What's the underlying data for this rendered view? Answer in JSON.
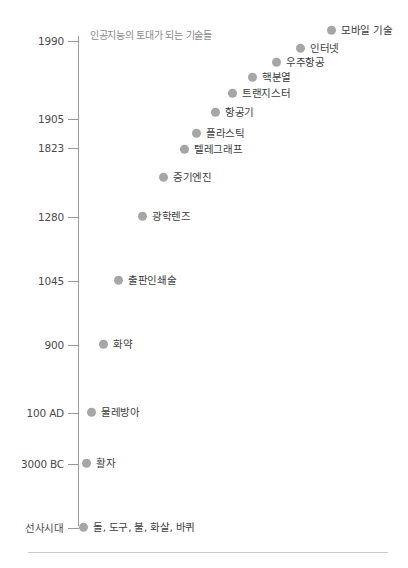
{
  "chart_data": {
    "type": "scatter",
    "title": "",
    "subtitle": "인공지능의 토대가 되는 기술들",
    "xlabel": "",
    "ylabel": "",
    "grid": false,
    "legend": "none",
    "axis": {
      "orientation": "vertical",
      "tick_labels": [
        "1990",
        "1905",
        "1823",
        "1280",
        "1045",
        "900",
        "100 AD",
        "3000 BC",
        "선사시대"
      ],
      "tick_y_px": [
        41,
        119,
        148,
        217,
        281,
        345,
        413,
        464,
        528
      ]
    },
    "points": [
      {
        "label": "모바일 기술",
        "x_px": 327,
        "y_px": 30
      },
      {
        "label": "인터넷",
        "x_px": 296,
        "y_px": 48
      },
      {
        "label": "우주항공",
        "x_px": 272,
        "y_px": 62
      },
      {
        "label": "핵분열",
        "x_px": 248,
        "y_px": 77
      },
      {
        "label": "트랜지스터",
        "x_px": 228,
        "y_px": 93
      },
      {
        "label": "항공기",
        "x_px": 211,
        "y_px": 112
      },
      {
        "label": "플라스틱",
        "x_px": 192,
        "y_px": 133
      },
      {
        "label": "텔레그래프",
        "x_px": 180,
        "y_px": 149
      },
      {
        "label": "증기엔진",
        "x_px": 159,
        "y_px": 177
      },
      {
        "label": "광학렌즈",
        "x_px": 138,
        "y_px": 216
      },
      {
        "label": "출판인쇄술",
        "x_px": 114,
        "y_px": 280
      },
      {
        "label": "화약",
        "x_px": 99,
        "y_px": 344
      },
      {
        "label": "물레방아",
        "x_px": 87,
        "y_px": 412
      },
      {
        "label": "활자",
        "x_px": 82,
        "y_px": 463
      },
      {
        "label": "돌, 도구, 불, 화살, 바퀴",
        "x_px": 79,
        "y_px": 527
      }
    ],
    "colors": {
      "dot": "#a6a6a6",
      "axis": "#9a9a9a",
      "tick_label": "#4a4a4a",
      "point_label": "#3d3d3d",
      "subtitle": "#8a8a8a",
      "background": "#ffffff"
    }
  }
}
